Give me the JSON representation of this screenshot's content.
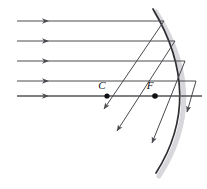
{
  "figure": {
    "width": 207,
    "height": 189,
    "background_color": "#ffffff",
    "ray_color": "#4a4a4f",
    "mirror_color": "#2f2f33",
    "axis_color": "#55555a",
    "label_color": "#141418"
  },
  "labels": {
    "center_of_curvature": "C",
    "focal_point": "F"
  },
  "points": [
    {
      "name": "center-of-curvature",
      "label": "C",
      "x": 107,
      "y": 96,
      "label_x": 102,
      "label_y": 89
    },
    {
      "name": "focal-point",
      "label": "F",
      "x": 155,
      "y": 96,
      "label_x": 150,
      "label_y": 89
    }
  ],
  "mirror": {
    "type": "concave-spherical-arc",
    "top_x": 153,
    "top_y": 9,
    "vertex_x": 202,
    "vertex_y": 96,
    "bottom_x": 156,
    "bottom_y": 173
  },
  "incoming_rays": [
    {
      "name": "incoming-ray-1",
      "y": 21,
      "x_start": 17,
      "x_end": 164,
      "arrow_x": 48
    },
    {
      "name": "incoming-ray-2",
      "y": 41,
      "x_start": 17,
      "x_end": 175,
      "arrow_x": 48
    },
    {
      "name": "incoming-ray-3",
      "y": 61,
      "x_start": 17,
      "x_end": 185,
      "arrow_x": 48
    },
    {
      "name": "incoming-ray-4",
      "y": 81,
      "x_start": 17,
      "x_end": 196,
      "arrow_x": 48
    }
  ],
  "principal_axis": {
    "name": "principal-axis",
    "y": 96,
    "x_start": 17,
    "x_end": 202,
    "arrow_x": 48
  },
  "reflected_rays": [
    {
      "name": "reflected-ray-1",
      "x1": 164,
      "y1": 21,
      "x2": 104,
      "y2": 109
    },
    {
      "name": "reflected-ray-2",
      "x1": 175,
      "y1": 41,
      "x2": 117,
      "y2": 131
    },
    {
      "name": "reflected-ray-3",
      "x1": 185,
      "y1": 61,
      "x2": 152,
      "y2": 143
    },
    {
      "name": "reflected-ray-4",
      "x1": 196,
      "y1": 81,
      "x2": 187,
      "y2": 112
    }
  ],
  "annotation": {
    "description": "Parallel rays reflect off a concave spherical mirror and cross the principal axis near the focal point F, showing spherical aberration; C marks the center of curvature."
  }
}
